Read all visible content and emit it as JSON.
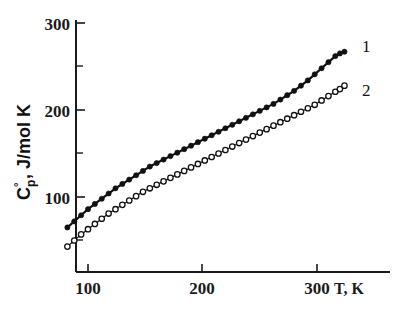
{
  "chart_data": {
    "type": "scatter",
    "title": "",
    "xlabel": "T, K",
    "ylabel": "C°p, J/mol K",
    "ylabel_parts": {
      "base": "C",
      "superscript": "°",
      "subscript": "p",
      "rest": ", J/mol K"
    },
    "xlim": [
      76,
      335
    ],
    "ylim": [
      0,
      310
    ],
    "xticks": [
      100,
      200,
      300
    ],
    "xtick_labels": [
      "100",
      "200",
      "300"
    ],
    "yticks": [
      100,
      200,
      300
    ],
    "ytick_labels": [
      "100",
      "200",
      "300"
    ],
    "yticks_minor": [
      50,
      150,
      250
    ],
    "grid": false,
    "legend_position": "right-inline",
    "series": [
      {
        "name": "1",
        "label": "1",
        "marker": "filled-circle",
        "color": "#111111",
        "x": [
          82,
          88,
          94,
          100,
          106,
          112,
          118,
          124,
          130,
          136,
          142,
          148,
          154,
          160,
          166,
          172,
          178,
          184,
          190,
          196,
          202,
          208,
          214,
          220,
          226,
          232,
          238,
          244,
          250,
          256,
          262,
          268,
          274,
          280,
          286,
          292,
          298,
          304,
          310,
          316,
          320,
          324
        ],
        "y": [
          65,
          72,
          79,
          86,
          92,
          98,
          104,
          110,
          115,
          120,
          125,
          130,
          135,
          139,
          143,
          147,
          151,
          155,
          159,
          163,
          167,
          171,
          175,
          179,
          183,
          187,
          191,
          195,
          199,
          203,
          207,
          212,
          217,
          222,
          228,
          234,
          241,
          248,
          255,
          262,
          265,
          267
        ]
      },
      {
        "name": "2",
        "label": "2",
        "marker": "open-circle",
        "color": "#111111",
        "x": [
          82,
          88,
          94,
          100,
          106,
          112,
          118,
          124,
          130,
          136,
          142,
          148,
          154,
          160,
          166,
          172,
          178,
          184,
          190,
          196,
          202,
          208,
          214,
          220,
          226,
          232,
          238,
          244,
          250,
          256,
          262,
          268,
          274,
          280,
          286,
          292,
          298,
          304,
          310,
          316,
          320,
          324
        ],
        "y": [
          43,
          50,
          57,
          63,
          69,
          75,
          81,
          86,
          91,
          96,
          101,
          106,
          110,
          114,
          118,
          122,
          126,
          130,
          134,
          138,
          142,
          146,
          150,
          154,
          158,
          162,
          166,
          170,
          174,
          178,
          182,
          186,
          190,
          194,
          198,
          202,
          206,
          211,
          216,
          221,
          224,
          228
        ]
      }
    ]
  },
  "labels": {
    "series_1": "1",
    "series_2": "2",
    "x_axis_title": "T, K",
    "y_axis_base": "C",
    "y_axis_degree": "°",
    "y_axis_subscript": "p",
    "y_axis_units": ", J/mol K",
    "xtick_100": "100",
    "xtick_200": "200",
    "xtick_300": "300",
    "ytick_100": "100",
    "ytick_200": "200",
    "ytick_300": "300"
  },
  "colors": {
    "axis": "#1a1a1a",
    "curve": "#111111",
    "marker_fill_open": "#ffffff",
    "background": "#ffffff"
  }
}
